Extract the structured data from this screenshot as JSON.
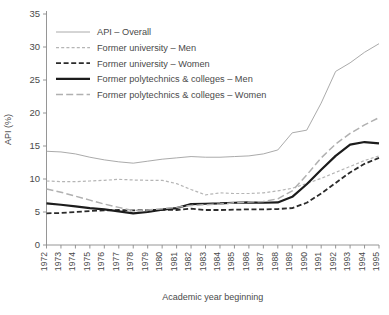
{
  "chart_data": {
    "type": "line",
    "title": "",
    "xlabel": "Academic year beginning",
    "ylabel": "API (%)",
    "ylim": [
      0,
      35
    ],
    "yticks": [
      0,
      5,
      10,
      15,
      20,
      25,
      30,
      35
    ],
    "grid": false,
    "legend_position": "upper-left-inside",
    "categories": [
      "1972",
      "1973",
      "1974",
      "1975",
      "1976",
      "1977",
      "1978",
      "1979",
      "1980",
      "1981",
      "1982",
      "1983",
      "1984",
      "1985",
      "1986",
      "1987",
      "1988",
      "1989",
      "1990",
      "1991",
      "1992",
      "1993",
      "1994",
      "1995"
    ],
    "series": [
      {
        "name": "API – Overall",
        "style": "thin-solid-gray",
        "color": "#a0a0a0",
        "width": 0.9,
        "dash": "",
        "values": [
          14.2,
          14.1,
          13.8,
          13.3,
          12.9,
          12.6,
          12.4,
          12.7,
          13.0,
          13.2,
          13.4,
          13.3,
          13.3,
          13.4,
          13.5,
          13.8,
          14.4,
          17.0,
          17.4,
          21.5,
          26.3,
          27.6,
          29.2,
          30.5
        ]
      },
      {
        "name": "Former university – Men",
        "style": "short-dash-light-gray",
        "color": "#b5b5b5",
        "width": 1.2,
        "dash": "3,2.2",
        "values": [
          9.7,
          9.6,
          9.6,
          9.7,
          9.8,
          9.95,
          9.85,
          9.8,
          9.8,
          9.3,
          8.4,
          7.6,
          7.9,
          7.8,
          7.8,
          7.9,
          8.2,
          8.6,
          9.3,
          10.1,
          11.0,
          11.9,
          12.8,
          13.5
        ]
      },
      {
        "name": "Former university – Women",
        "style": "medium-dash-black",
        "color": "#2b2b2b",
        "width": 1.8,
        "dash": "5,2.6",
        "values": [
          4.8,
          4.85,
          5.0,
          5.15,
          5.25,
          5.3,
          5.25,
          5.3,
          5.35,
          5.3,
          5.5,
          5.3,
          5.3,
          5.35,
          5.4,
          5.4,
          5.45,
          5.6,
          6.4,
          7.8,
          9.4,
          11.0,
          12.3,
          13.2
        ]
      },
      {
        "name": "Former polytechnics & colleges – Men",
        "style": "thick-solid-black",
        "color": "#1c1c1c",
        "width": 2.2,
        "dash": "",
        "values": [
          6.3,
          6.1,
          5.85,
          5.6,
          5.4,
          5.1,
          4.8,
          5.0,
          5.35,
          5.6,
          6.2,
          6.25,
          6.3,
          6.4,
          6.45,
          6.4,
          6.45,
          7.3,
          9.2,
          11.4,
          13.5,
          15.2,
          15.6,
          15.4
        ]
      },
      {
        "name": "Former polytechnics & colleges – Women",
        "style": "long-dash-gray",
        "color": "#b0b0b0",
        "width": 1.5,
        "dash": "7,3.2",
        "values": [
          8.5,
          8.0,
          7.4,
          6.8,
          6.2,
          5.7,
          5.2,
          5.3,
          5.5,
          5.7,
          6.0,
          6.1,
          6.2,
          6.4,
          6.5,
          6.6,
          7.0,
          8.2,
          10.6,
          13.2,
          15.3,
          16.9,
          18.2,
          19.3
        ]
      }
    ]
  },
  "legend": {
    "items": [
      {
        "label": "API – Overall"
      },
      {
        "label": "Former university – Men"
      },
      {
        "label": "Former university – Women"
      },
      {
        "label": "Former polytechnics & colleges – Men"
      },
      {
        "label": "Former polytechnics & colleges – Women"
      }
    ]
  }
}
